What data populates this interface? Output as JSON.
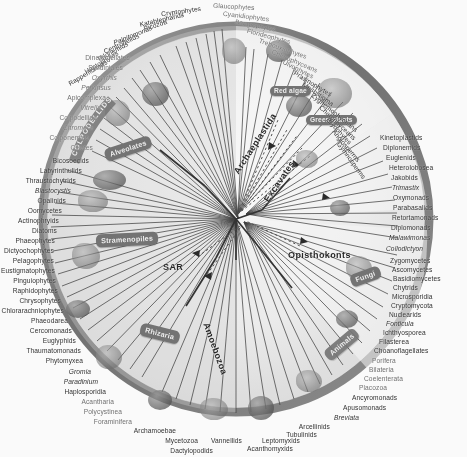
{
  "figure": {
    "type": "circular-phylogeny"
  },
  "supergroups": [
    {
      "name": "SAR",
      "x": 163,
      "y": 268,
      "rot": 0
    },
    {
      "name": "Archaeplastida",
      "x": 290,
      "y": 148,
      "rot": 62
    },
    {
      "name": "Excavates",
      "x": 312,
      "y": 175,
      "rot": 64
    },
    {
      "name": "Opisthokonts",
      "x": 318,
      "y": 256,
      "rot": 0
    },
    {
      "name": "Amoebozoa",
      "x": 212,
      "y": 320,
      "rot": 72
    }
  ],
  "pills": [
    {
      "name": "Alveolates",
      "x": 110,
      "y": 147
    },
    {
      "name": "Stramenopiles",
      "x": 101,
      "y": 238
    },
    {
      "name": "Rhizaria",
      "x": 146,
      "y": 332
    },
    {
      "name": "Red algae",
      "x": 274,
      "y": 95
    },
    {
      "name": "Green plants",
      "x": 316,
      "y": 122
    },
    {
      "name": "Fungi",
      "x": 358,
      "y": 276
    },
    {
      "name": "Animals",
      "x": 330,
      "y": 343
    }
  ],
  "arc_label": {
    "name": "Apicomplexa-arc",
    "text": "COLPODELLIDS"
  },
  "taxa": {
    "top_left": [
      "Rappemonads",
      "Haptophytes",
      "Telonemids",
      "Centrohelids",
      "Palpitomonas",
      "Picozoa",
      "Katablepharids",
      "Cryptophytes"
    ],
    "top_right": [
      "Glaucophytes",
      "Cyanidiophytes",
      "Bangiophytes",
      "Florideophytes",
      "Trebouxiophytes",
      "Chlorophyceans",
      "Ulvophytes",
      "Prasinophytes",
      "Mesostigma",
      "Zygnemophyceans",
      "Charophyceans",
      "Bryophytes",
      "Angiosperms",
      "Gymnosperms"
    ],
    "right": [
      "Kinetoplastids",
      "Diplonemids",
      "Euglenids",
      "Heterolobosea",
      "Jakobids",
      "Trimastix",
      "Oxymonads",
      "Parabasalids",
      "Retortamonads",
      "Diplomonads",
      "Malawimonas",
      "Collodictyon",
      "Zygomycetes",
      "Ascomycetes",
      "Basidiomycetes",
      "Chytrids",
      "Microsporidia",
      "Cryptomycota",
      "Nuclearids",
      "Fonticula",
      "Ichthyosporea",
      "Filasterea",
      "Choanoflagellates",
      "Porifera",
      "Bilateria",
      "Coelenterata",
      "Placozoa",
      "Ancyromonads",
      "Apusomonads",
      "Breviata"
    ],
    "bottom": [
      "Arcellinids",
      "Tubulinids",
      "Leptomyxids",
      "Acanthomyxids",
      "Vannellids",
      "Mycetozoa",
      "Dactylopodids",
      "Archamoebae"
    ],
    "left": [
      "Dinoflagellates",
      "Syndiniales",
      "Oxyrrhis",
      "Perkinsus",
      "Apicomplexa",
      "Vitrella",
      "Colpodellida",
      "Chromera",
      "Colponemids",
      "Ciliates",
      "Bicosoecids",
      "Labyrinthulids",
      "Thraustochytrids",
      "Blastocystis",
      "Opalinids",
      "Oomycetes",
      "Actinophryids",
      "Diatoms",
      "Phaeophytes",
      "Dictyochophytes",
      "Pelagophytes",
      "Eustigmatophytes",
      "Pinguiophytes",
      "Raphidophytes",
      "Chrysophytes",
      "Chlorarachniophytes",
      "Phaeodarea",
      "Cercomonads",
      "Euglyphids",
      "Thaumatomonads",
      "Phytomyxea",
      "Gromia",
      "Paradinium",
      "Haplosporidia",
      "Acantharia",
      "Polycystinea",
      "Foraminifera"
    ]
  },
  "label_placement": [
    {
      "t": "Rappemonads",
      "x": 107,
      "y": 62,
      "a": "r",
      "rot": -31,
      "s": "n"
    },
    {
      "t": "Haptophytes",
      "x": 118,
      "y": 53,
      "a": "r",
      "rot": -31,
      "s": "n"
    },
    {
      "t": "Telonemids",
      "x": 128,
      "y": 44,
      "a": "r",
      "rot": -28,
      "s": "n"
    },
    {
      "t": "Centrohelids",
      "x": 139,
      "y": 36,
      "a": "r",
      "rot": -25,
      "s": "n"
    },
    {
      "t": "Palpitomonas",
      "x": 152,
      "y": 28,
      "a": "r",
      "rot": -22,
      "s": "i"
    },
    {
      "t": "Picozoa",
      "x": 167,
      "y": 22,
      "a": "r",
      "rot": -18,
      "s": "n"
    },
    {
      "t": "Katablepharids",
      "x": 184,
      "y": 15,
      "a": "r",
      "rot": -13,
      "s": "n"
    },
    {
      "t": "Cryptophytes",
      "x": 201,
      "y": 9,
      "a": "r",
      "rot": -8,
      "s": "n"
    },
    {
      "t": "Glaucophytes",
      "x": 213,
      "y": 6,
      "a": "l",
      "rot": 3,
      "s": "t"
    },
    {
      "t": "Cyanidiophytes",
      "x": 223,
      "y": 14,
      "a": "l",
      "rot": 7,
      "s": "t"
    },
    {
      "t": "Bangiophytes",
      "x": 235,
      "y": 22,
      "a": "l",
      "rot": 11,
      "s": "t"
    },
    {
      "t": "Florideophytes",
      "x": 247,
      "y": 31,
      "a": "l",
      "rot": 15,
      "s": "t"
    },
    {
      "t": "Trebouxiophytes",
      "x": 259,
      "y": 41,
      "a": "l",
      "rot": 19,
      "s": "t"
    },
    {
      "t": "Chlorophyceans",
      "x": 272,
      "y": 52,
      "a": "l",
      "rot": 23,
      "s": "t"
    },
    {
      "t": "Ulvophytes",
      "x": 283,
      "y": 62,
      "a": "l",
      "rot": 27,
      "s": "t"
    },
    {
      "t": "Prasinophytes",
      "x": 294,
      "y": 73,
      "a": "l",
      "rot": 31,
      "s": "n"
    },
    {
      "t": "Mesostigma",
      "x": 303,
      "y": 84,
      "a": "l",
      "rot": 35,
      "s": "n"
    },
    {
      "t": "Zygnemophyceans",
      "x": 312,
      "y": 95,
      "a": "l",
      "rot": 39,
      "s": "n"
    },
    {
      "t": "Charophyceans",
      "x": 320,
      "y": 107,
      "a": "l",
      "rot": 43,
      "s": "n"
    },
    {
      "t": "Bryophytes",
      "x": 327,
      "y": 119,
      "a": "l",
      "rot": 47,
      "s": "n"
    },
    {
      "t": "Angiosperms",
      "x": 333,
      "y": 131,
      "a": "l",
      "rot": 50,
      "s": "n"
    },
    {
      "t": "Gymnosperms",
      "x": 338,
      "y": 143,
      "a": "l",
      "rot": 54,
      "s": "n"
    },
    {
      "t": "Kinetoplastids",
      "x": 380,
      "y": 138,
      "a": "l",
      "rot": 0,
      "s": "n"
    },
    {
      "t": "Diplonemids",
      "x": 383,
      "y": 148,
      "a": "l",
      "rot": 0,
      "s": "n"
    },
    {
      "t": "Euglenids",
      "x": 386,
      "y": 158,
      "a": "l",
      "rot": 0,
      "s": "n"
    },
    {
      "t": "Heterolobosea",
      "x": 389,
      "y": 168,
      "a": "l",
      "rot": 0,
      "s": "n"
    },
    {
      "t": "Jakobids",
      "x": 391,
      "y": 178,
      "a": "l",
      "rot": 0,
      "s": "n"
    },
    {
      "t": "Trimastix",
      "x": 392,
      "y": 188,
      "a": "l",
      "rot": 0,
      "s": "i"
    },
    {
      "t": "Oxymonads",
      "x": 393,
      "y": 198,
      "a": "l",
      "rot": 0,
      "s": "n"
    },
    {
      "t": "Parabasalids",
      "x": 393,
      "y": 208,
      "a": "l",
      "rot": 0,
      "s": "n"
    },
    {
      "t": "Retortamonads",
      "x": 392,
      "y": 218,
      "a": "l",
      "rot": 0,
      "s": "n"
    },
    {
      "t": "Diplomonads",
      "x": 391,
      "y": 228,
      "a": "l",
      "rot": 0,
      "s": "n"
    },
    {
      "t": "Malawimonas",
      "x": 389,
      "y": 238,
      "a": "l",
      "rot": 0,
      "s": "i"
    },
    {
      "t": "Collodictyon",
      "x": 386,
      "y": 249,
      "a": "l",
      "rot": 0,
      "s": "i"
    },
    {
      "t": "Zygomycetes",
      "x": 390,
      "y": 261,
      "a": "l",
      "rot": 0,
      "s": "n"
    },
    {
      "t": "Ascomycetes",
      "x": 392,
      "y": 270,
      "a": "l",
      "rot": 0,
      "s": "n"
    },
    {
      "t": "Basidiomycetes",
      "x": 393,
      "y": 279,
      "a": "l",
      "rot": 0,
      "s": "n"
    },
    {
      "t": "Chytrids",
      "x": 393,
      "y": 288,
      "a": "l",
      "rot": 0,
      "s": "n"
    },
    {
      "t": "Microsporidia",
      "x": 392,
      "y": 297,
      "a": "l",
      "rot": 0,
      "s": "n"
    },
    {
      "t": "Cryptomycota",
      "x": 391,
      "y": 306,
      "a": "l",
      "rot": 0,
      "s": "n"
    },
    {
      "t": "Nuclearids",
      "x": 389,
      "y": 315,
      "a": "l",
      "rot": 0,
      "s": "n"
    },
    {
      "t": "Fonticula",
      "x": 386,
      "y": 324,
      "a": "l",
      "rot": 0,
      "s": "i"
    },
    {
      "t": "Ichthyosporea",
      "x": 383,
      "y": 333,
      "a": "l",
      "rot": 0,
      "s": "n"
    },
    {
      "t": "Filasterea",
      "x": 379,
      "y": 342,
      "a": "l",
      "rot": 0,
      "s": "n"
    },
    {
      "t": "Choanoflagellates",
      "x": 374,
      "y": 351,
      "a": "l",
      "rot": 0,
      "s": "n"
    },
    {
      "t": "Porifera",
      "x": 372,
      "y": 361,
      "a": "l",
      "rot": 0,
      "s": "t"
    },
    {
      "t": "Bilateria",
      "x": 369,
      "y": 370,
      "a": "l",
      "rot": 0,
      "s": "t"
    },
    {
      "t": "Coelenterata",
      "x": 364,
      "y": 379,
      "a": "l",
      "rot": 0,
      "s": "t"
    },
    {
      "t": "Placozoa",
      "x": 359,
      "y": 388,
      "a": "l",
      "rot": 0,
      "s": "t"
    },
    {
      "t": "Ancyromonads",
      "x": 352,
      "y": 398,
      "a": "l",
      "rot": 0,
      "s": "n"
    },
    {
      "t": "Apusomonads",
      "x": 343,
      "y": 408,
      "a": "l",
      "rot": 0,
      "s": "n"
    },
    {
      "t": "Breviata",
      "x": 334,
      "y": 418,
      "a": "l",
      "rot": 0,
      "s": "i"
    },
    {
      "t": "Arcellinids",
      "x": 330,
      "y": 427,
      "a": "r",
      "rot": 0,
      "s": "n"
    },
    {
      "t": "Tubulinids",
      "x": 317,
      "y": 435,
      "a": "r",
      "rot": 0,
      "s": "n"
    },
    {
      "t": "Leptomyxids",
      "x": 300,
      "y": 441,
      "a": "r",
      "rot": 0,
      "s": "n"
    },
    {
      "t": "Acanthomyxids",
      "x": 293,
      "y": 449,
      "a": "r",
      "rot": 0,
      "s": "n"
    },
    {
      "t": "Vannellids",
      "x": 242,
      "y": 441,
      "a": "r",
      "rot": 0,
      "s": "n"
    },
    {
      "t": "Mycetozoa",
      "x": 198,
      "y": 441,
      "a": "r",
      "rot": 0,
      "s": "n"
    },
    {
      "t": "Dactylopodids",
      "x": 213,
      "y": 451,
      "a": "r",
      "rot": 0,
      "s": "n"
    },
    {
      "t": "Archamoebae",
      "x": 176,
      "y": 431,
      "a": "r",
      "rot": 0,
      "s": "n"
    },
    {
      "t": "Foraminifera",
      "x": 132,
      "y": 422,
      "a": "r",
      "rot": 0,
      "s": "t"
    },
    {
      "t": "Polycystinea",
      "x": 122,
      "y": 412,
      "a": "r",
      "rot": 0,
      "s": "t"
    },
    {
      "t": "Acantharia",
      "x": 114,
      "y": 402,
      "a": "r",
      "rot": 0,
      "s": "t"
    },
    {
      "t": "Haplosporidia",
      "x": 106,
      "y": 392,
      "a": "r",
      "rot": 0,
      "s": "n"
    },
    {
      "t": "Paradinium",
      "x": 98,
      "y": 382,
      "a": "r",
      "rot": 0,
      "s": "i"
    },
    {
      "t": "Gromia",
      "x": 91,
      "y": 372,
      "a": "r",
      "rot": 0,
      "s": "i"
    },
    {
      "t": "Phytomyxea",
      "x": 83,
      "y": 361,
      "a": "r",
      "rot": 0,
      "s": "n"
    },
    {
      "t": "Thaumatomonads",
      "x": 81,
      "y": 351,
      "a": "r",
      "rot": 0,
      "s": "n"
    },
    {
      "t": "Euglyphids",
      "x": 76,
      "y": 341,
      "a": "r",
      "rot": 0,
      "s": "n"
    },
    {
      "t": "Cercomonads",
      "x": 72,
      "y": 331,
      "a": "r",
      "rot": 0,
      "s": "n"
    },
    {
      "t": "Phaeodarea",
      "x": 68,
      "y": 321,
      "a": "r",
      "rot": 0,
      "s": "n"
    },
    {
      "t": "Chlorarachniophytes",
      "x": 64,
      "y": 311,
      "a": "r",
      "rot": 0,
      "s": "n"
    },
    {
      "t": "Chrysophytes",
      "x": 61,
      "y": 301,
      "a": "r",
      "rot": 0,
      "s": "n"
    },
    {
      "t": "Raphidophytes",
      "x": 58,
      "y": 291,
      "a": "r",
      "rot": 0,
      "s": "n"
    },
    {
      "t": "Pinguiophytes",
      "x": 56,
      "y": 281,
      "a": "r",
      "rot": 0,
      "s": "n"
    },
    {
      "t": "Eustigmatophytes",
      "x": 55,
      "y": 271,
      "a": "r",
      "rot": 0,
      "s": "n"
    },
    {
      "t": "Pelagophytes",
      "x": 54,
      "y": 261,
      "a": "r",
      "rot": 0,
      "s": "n"
    },
    {
      "t": "Dictyochophytes",
      "x": 54,
      "y": 251,
      "a": "r",
      "rot": 0,
      "s": "n"
    },
    {
      "t": "Phaeophytes",
      "x": 55,
      "y": 241,
      "a": "r",
      "rot": 0,
      "s": "n"
    },
    {
      "t": "Diatoms",
      "x": 57,
      "y": 231,
      "a": "r",
      "rot": 0,
      "s": "n"
    },
    {
      "t": "Actinophryids",
      "x": 59,
      "y": 221,
      "a": "r",
      "rot": 0,
      "s": "n"
    },
    {
      "t": "Oomycetes",
      "x": 62,
      "y": 211,
      "a": "r",
      "rot": 0,
      "s": "n"
    },
    {
      "t": "Opalinids",
      "x": 66,
      "y": 201,
      "a": "r",
      "rot": 0,
      "s": "n"
    },
    {
      "t": "Blastocystis",
      "x": 71,
      "y": 191,
      "a": "r",
      "rot": 0,
      "s": "i"
    },
    {
      "t": "Thraustochytrids",
      "x": 76,
      "y": 181,
      "a": "r",
      "rot": 0,
      "s": "n"
    },
    {
      "t": "Labyrinthulids",
      "x": 82,
      "y": 171,
      "a": "r",
      "rot": 0,
      "s": "n"
    },
    {
      "t": "Bicosoecids",
      "x": 89,
      "y": 161,
      "a": "r",
      "rot": 0,
      "s": "n"
    },
    {
      "t": "Ciliates",
      "x": 93,
      "y": 148,
      "a": "r",
      "rot": 0,
      "s": "t"
    },
    {
      "t": "Colponemids",
      "x": 89,
      "y": 138,
      "a": "r",
      "rot": 0,
      "s": "t"
    },
    {
      "t": "Chromera",
      "x": 93,
      "y": 128,
      "a": "r",
      "rot": 0,
      "s": "it"
    },
    {
      "t": "Colpodellida",
      "x": 97,
      "y": 118,
      "a": "r",
      "rot": 0,
      "s": "t"
    },
    {
      "t": "Vitrella",
      "x": 101,
      "y": 108,
      "a": "r",
      "rot": 0,
      "s": "it"
    },
    {
      "t": "Apicomplexa",
      "x": 106,
      "y": 98,
      "a": "r",
      "rot": 0,
      "s": "t"
    },
    {
      "t": "Perkinsus",
      "x": 111,
      "y": 88,
      "a": "r",
      "rot": 0,
      "s": "it"
    },
    {
      "t": "Oxyrrhis",
      "x": 117,
      "y": 78,
      "a": "r",
      "rot": 0,
      "s": "it"
    },
    {
      "t": "Syndiniales",
      "x": 123,
      "y": 68,
      "a": "r",
      "rot": 0,
      "s": "t"
    },
    {
      "t": "Dinoflagellates",
      "x": 130,
      "y": 58,
      "a": "r",
      "rot": 0,
      "s": "t"
    }
  ]
}
